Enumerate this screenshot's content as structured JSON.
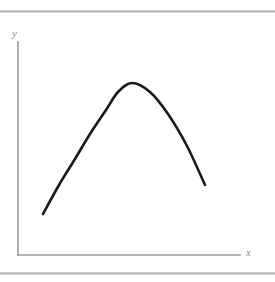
{
  "figure": {
    "background_color": "#ffffff",
    "axis_color": "#9a9a9a",
    "curve_color": "#1a1a1a",
    "rule_color": "#b4b4b4",
    "label_color": "#8c8c8c",
    "y_axis_label": "y",
    "x_axis_label": "x"
  },
  "chart_data": {
    "type": "line",
    "title": "",
    "xlabel": "x",
    "ylabel": "y",
    "grid": false,
    "legend": "none",
    "axis_style": "L-shaped spines, no ticks, no tick labels",
    "series": [
      {
        "name": "curve",
        "description": "single smooth concave-down curve, rising to an interior maximum then falling more steeply",
        "x": [
          0.11,
          0.18,
          0.25,
          0.32,
          0.4,
          0.46,
          0.52,
          0.6,
          0.68,
          0.76,
          0.84
        ],
        "y": [
          0.19,
          0.34,
          0.48,
          0.61,
          0.74,
          0.81,
          0.84,
          0.8,
          0.68,
          0.51,
          0.33
        ],
        "x_pixels": [
          43,
          59,
          75,
          90,
          106,
          118,
          132,
          150,
          168,
          187,
          205
        ],
        "y_pixels": [
          214,
          185,
          159,
          134,
          110,
          92,
          83,
          92,
          114,
          146,
          185
        ]
      }
    ],
    "xlim": [
      0,
      1
    ],
    "ylim": [
      0,
      1
    ],
    "annotations": []
  }
}
